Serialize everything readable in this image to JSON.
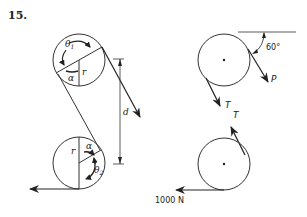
{
  "problem": {
    "number": "15."
  },
  "left_figure": {
    "top_pulley": {
      "angle_label": "θ",
      "angle_sub": "1",
      "alpha_label": "α",
      "radius_label": "r"
    },
    "bottom_pulley": {
      "angle_label": "θ",
      "angle_sub": "2",
      "alpha_label": "α",
      "radius_label": "r"
    },
    "distance_label": "d"
  },
  "right_figure": {
    "angle_label": "60°",
    "force_p_label": "P",
    "tension_top_label": "T",
    "tension_bottom_label": "T",
    "load_label": "1000 N"
  },
  "colors": {
    "stroke": "#333333",
    "background": "#ffffff"
  }
}
